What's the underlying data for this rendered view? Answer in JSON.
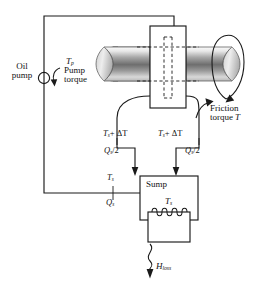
{
  "diagram": {
    "type": "engineering-schematic",
    "background_color": "#ffffff",
    "line_color": "#1a1a1a",
    "shaft_fill_light": "#f2f2f2",
    "shaft_fill_dark": "#636363"
  },
  "labels": {
    "oil_pump_line1": "Oil",
    "oil_pump_line2": "pump",
    "pump_torque_symbol_main": "T",
    "pump_torque_symbol_sub": "p",
    "pump_torque_line1": "Pump",
    "pump_torque_line2": "torque",
    "friction_torque_line1": "Friction",
    "friction_torque_line2": "torque",
    "friction_torque_symbol": "T",
    "sump_title": "Sump",
    "sump_temp_main": "T",
    "sump_temp_sub": "s",
    "inlet_temp_main": "T",
    "inlet_temp_sub": "s",
    "inlet_flow_main": "Q",
    "inlet_flow_sub": "s",
    "heat_loss_main": "H",
    "heat_loss_sub": "loss",
    "outlet_left_temp": "T",
    "outlet_left_temp_sub": "s",
    "outlet_left_delta": "+ ΔT",
    "outlet_left_flow": "Q",
    "outlet_left_flow_sub": "s",
    "outlet_left_flow_div": "/2",
    "outlet_right_temp": "T",
    "outlet_right_temp_sub": "s",
    "outlet_right_delta": "+ ΔT",
    "outlet_right_flow": "Q",
    "outlet_right_flow_sub": "s",
    "outlet_right_flow_div": "/2"
  },
  "components": {
    "pump": "oil-pump-symbol",
    "bearing_housing": "bearing-housing-rectangle",
    "shaft": "rotating-shaft-cylinder",
    "sump": "sump-reservoir-box",
    "heater_coil": "heater-coil-element",
    "rotation_arrow": "shaft-rotation-arrow",
    "pump_torque_arrow": "pump-torque-curved-arrow",
    "friction_torque_arrow": "friction-torque-curved-arrow",
    "heat_loss_arrow": "wavy-heat-loss-arrow"
  }
}
